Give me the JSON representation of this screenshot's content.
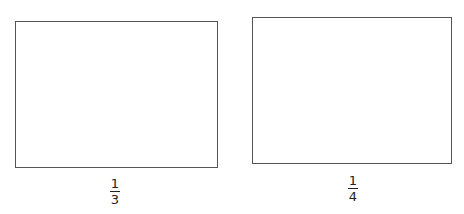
{
  "figures": [
    {
      "shape": "rectangle",
      "label": {
        "numerator": "1",
        "denominator": "3"
      }
    },
    {
      "shape": "rectangle",
      "label": {
        "numerator": "1",
        "denominator": "4"
      }
    }
  ],
  "colors": {
    "outline": "#555555",
    "text": "#222222",
    "background": "#ffffff"
  }
}
